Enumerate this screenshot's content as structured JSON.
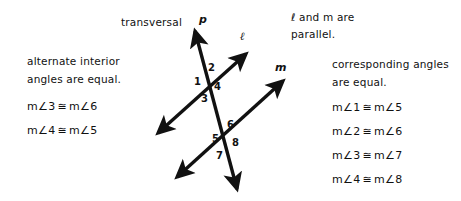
{
  "figure": {
    "background_color": "#ffffff",
    "stroke_color": "#111111",
    "transversal_label": "transversal",
    "line_labels": {
      "transversal_point": "p",
      "line_l": "ℓ",
      "line_m": "m"
    },
    "angle_numbers": {
      "upper_left": "1",
      "upper_top": "2",
      "upper_bottom": "3",
      "upper_right": "4",
      "lower_left": "5",
      "lower_top": "6",
      "lower_bottom": "7",
      "lower_right": "8"
    }
  },
  "left_block": {
    "heading_line_1": "alternate interior",
    "heading_line_2": "angles are equal.",
    "equations": [
      {
        "left": "m∠3",
        "symbol": "≅",
        "right": "m∠6"
      },
      {
        "left": "m∠4",
        "symbol": "≅",
        "right": "m∠5"
      }
    ]
  },
  "parallel_note": {
    "line_1": "ℓ and m are",
    "line_2": "parallel."
  },
  "right_block": {
    "heading_line_1": "corresponding angles",
    "heading_line_2": "are equal.",
    "equations": [
      {
        "left": "m∠1",
        "symbol": "≅",
        "right": "m∠5"
      },
      {
        "left": "m∠2",
        "symbol": "≅",
        "right": "m∠6"
      },
      {
        "left": "m∠3",
        "symbol": "≅",
        "right": "m∠7"
      },
      {
        "left": "m∠4",
        "symbol": "≅",
        "right": "m∠8"
      }
    ]
  }
}
